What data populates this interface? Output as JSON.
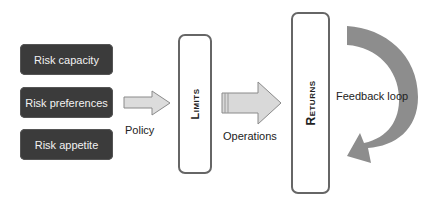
{
  "inputs": [
    {
      "label": "Risk capacity"
    },
    {
      "label": "Risk preferences"
    },
    {
      "label": "Risk appetite"
    }
  ],
  "arrows": {
    "policy": "Policy",
    "operations": "Operations",
    "feedback": "Feedback loop"
  },
  "stages": {
    "limits": "Limits",
    "returns": "Returns"
  },
  "colors": {
    "input_box": "#3b3b3b",
    "arrow_fill": "#d9d9d9",
    "feedback_arrow": "#8a8a8a",
    "stage_border": "#666666"
  }
}
